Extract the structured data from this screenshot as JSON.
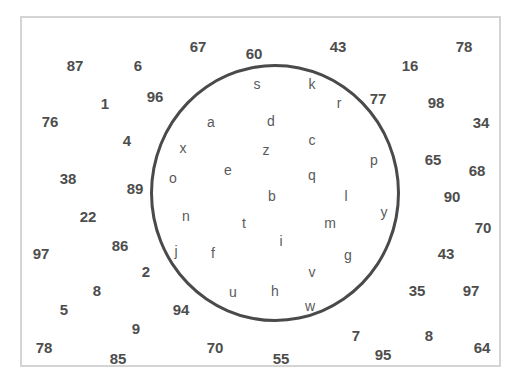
{
  "puzzle": {
    "numbers": [
      {
        "v": "87",
        "x": 75,
        "y": 65
      },
      {
        "v": "6",
        "x": 138,
        "y": 65
      },
      {
        "v": "67",
        "x": 198,
        "y": 46
      },
      {
        "v": "60",
        "x": 254,
        "y": 53
      },
      {
        "v": "43",
        "x": 338,
        "y": 46
      },
      {
        "v": "16",
        "x": 410,
        "y": 65
      },
      {
        "v": "78",
        "x": 464,
        "y": 46
      },
      {
        "v": "1",
        "x": 105,
        "y": 103
      },
      {
        "v": "96",
        "x": 155,
        "y": 96
      },
      {
        "v": "77",
        "x": 378,
        "y": 98
      },
      {
        "v": "98",
        "x": 436,
        "y": 102
      },
      {
        "v": "76",
        "x": 50,
        "y": 121
      },
      {
        "v": "34",
        "x": 481,
        "y": 122
      },
      {
        "v": "4",
        "x": 127,
        "y": 140
      },
      {
        "v": "65",
        "x": 433,
        "y": 159
      },
      {
        "v": "68",
        "x": 477,
        "y": 170
      },
      {
        "v": "38",
        "x": 68,
        "y": 178
      },
      {
        "v": "89",
        "x": 135,
        "y": 188
      },
      {
        "v": "90",
        "x": 452,
        "y": 196
      },
      {
        "v": "22",
        "x": 88,
        "y": 216
      },
      {
        "v": "70",
        "x": 483,
        "y": 227
      },
      {
        "v": "97",
        "x": 41,
        "y": 253
      },
      {
        "v": "86",
        "x": 120,
        "y": 245
      },
      {
        "v": "43",
        "x": 446,
        "y": 253
      },
      {
        "v": "2",
        "x": 146,
        "y": 271
      },
      {
        "v": "8",
        "x": 97,
        "y": 290
      },
      {
        "v": "35",
        "x": 417,
        "y": 290
      },
      {
        "v": "97",
        "x": 471,
        "y": 290
      },
      {
        "v": "5",
        "x": 64,
        "y": 309
      },
      {
        "v": "94",
        "x": 181,
        "y": 309
      },
      {
        "v": "9",
        "x": 136,
        "y": 328
      },
      {
        "v": "7",
        "x": 356,
        "y": 335
      },
      {
        "v": "8",
        "x": 429,
        "y": 335
      },
      {
        "v": "78",
        "x": 44,
        "y": 347
      },
      {
        "v": "70",
        "x": 215,
        "y": 347
      },
      {
        "v": "64",
        "x": 482,
        "y": 347
      },
      {
        "v": "85",
        "x": 118,
        "y": 358
      },
      {
        "v": "55",
        "x": 281,
        "y": 358
      },
      {
        "v": "95",
        "x": 383,
        "y": 354
      }
    ],
    "letters": [
      {
        "v": "s",
        "x": 257,
        "y": 84
      },
      {
        "v": "k",
        "x": 312,
        "y": 84
      },
      {
        "v": "r",
        "x": 339,
        "y": 103
      },
      {
        "v": "a",
        "x": 211,
        "y": 122
      },
      {
        "v": "d",
        "x": 271,
        "y": 121
      },
      {
        "v": "c",
        "x": 312,
        "y": 140
      },
      {
        "v": "x",
        "x": 183,
        "y": 148
      },
      {
        "v": "z",
        "x": 266,
        "y": 150
      },
      {
        "v": "p",
        "x": 374,
        "y": 160
      },
      {
        "v": "e",
        "x": 228,
        "y": 170
      },
      {
        "v": "q",
        "x": 312,
        "y": 175
      },
      {
        "v": "o",
        "x": 173,
        "y": 178
      },
      {
        "v": "b",
        "x": 272,
        "y": 196
      },
      {
        "v": "l",
        "x": 346,
        "y": 196
      },
      {
        "v": "y",
        "x": 384,
        "y": 212
      },
      {
        "v": "n",
        "x": 186,
        "y": 216
      },
      {
        "v": "t",
        "x": 244,
        "y": 223
      },
      {
        "v": "m",
        "x": 330,
        "y": 223
      },
      {
        "v": "i",
        "x": 281,
        "y": 241
      },
      {
        "v": "j",
        "x": 176,
        "y": 251
      },
      {
        "v": "f",
        "x": 213,
        "y": 253
      },
      {
        "v": "g",
        "x": 348,
        "y": 255
      },
      {
        "v": "v",
        "x": 312,
        "y": 272
      },
      {
        "v": "u",
        "x": 233,
        "y": 292
      },
      {
        "v": "h",
        "x": 275,
        "y": 291
      },
      {
        "v": "w",
        "x": 310,
        "y": 306
      }
    ]
  }
}
